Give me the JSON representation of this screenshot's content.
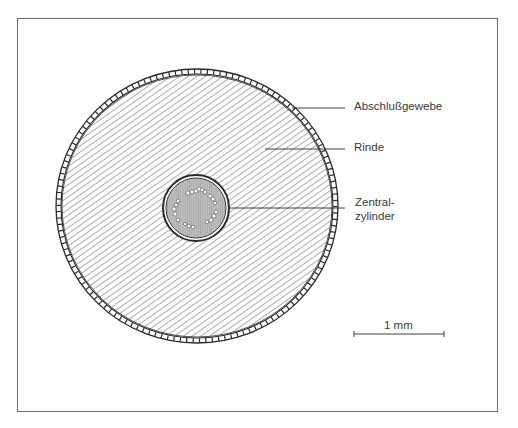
{
  "diagram": {
    "type": "cross-section",
    "labels": [
      {
        "id": "abschlussgewebe",
        "text": "Abschlußgewebe"
      },
      {
        "id": "rinde",
        "text": "Rinde"
      },
      {
        "id": "zentralzylinder",
        "line1": "Zentral-",
        "line2": "zylinder"
      }
    ],
    "scale_bar": {
      "label": "1 mm"
    },
    "colors": {
      "line": "#2a2a2a",
      "frame": "#6a6a6a",
      "hatch": "#4a4a4a",
      "core_fill": "#bdbdbd"
    }
  }
}
